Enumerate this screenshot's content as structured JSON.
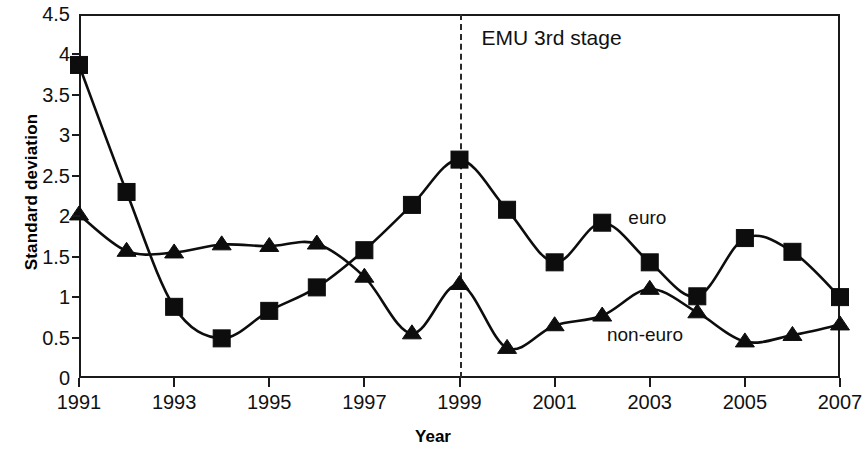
{
  "figure": {
    "background": "#ffffff",
    "ink_color": "#0d0d0d"
  },
  "axes": {
    "y_title": "Standard deviation",
    "x_title": "Year",
    "y_ticks": [
      "0",
      "0.5",
      "1",
      "1.5",
      "2",
      "2.5",
      "3",
      "3.5",
      "4",
      "4.5"
    ],
    "x_ticks": [
      "1991",
      "1993",
      "1995",
      "1997",
      "1999",
      "2001",
      "2003",
      "2005",
      "2007"
    ]
  },
  "annotations": {
    "emu_label": "EMU 3rd stage",
    "emu_year": 1999,
    "euro_label": "euro",
    "non_euro_label": "non-euro"
  },
  "chart_data": {
    "type": "line",
    "title": "",
    "xlabel": "Year",
    "ylabel": "Standard deviation",
    "xlim": [
      1991,
      2007
    ],
    "ylim": [
      0,
      4.5
    ],
    "ytick_step": 0.5,
    "xtick_step": 2,
    "grid": false,
    "legend_position": "inline-labels",
    "x": [
      1991,
      1992,
      1993,
      1994,
      1995,
      1996,
      1997,
      1998,
      1999,
      2000,
      2001,
      2002,
      2003,
      2004,
      2005,
      2006,
      2007
    ],
    "series": [
      {
        "name": "euro",
        "marker": "square",
        "color": "#0d0d0d",
        "values": [
          3.87,
          2.3,
          0.88,
          0.49,
          0.83,
          1.12,
          1.58,
          2.14,
          2.7,
          2.08,
          1.43,
          1.92,
          1.43,
          1.01,
          1.73,
          1.56,
          1.0
        ]
      },
      {
        "name": "non-euro",
        "marker": "triangle",
        "color": "#0d0d0d",
        "values": [
          2.02,
          1.57,
          1.55,
          1.65,
          1.63,
          1.66,
          1.25,
          0.55,
          1.16,
          0.37,
          0.65,
          0.77,
          1.1,
          0.81,
          0.45,
          0.53,
          0.66
        ]
      }
    ],
    "annotations": [
      {
        "type": "vline",
        "x": 1999,
        "style": "dashed",
        "text": "EMU 3rd stage"
      },
      {
        "type": "series-label",
        "text": "euro",
        "x": 2002.6,
        "y": 1.95
      },
      {
        "type": "series-label",
        "text": "non-euro",
        "x": 2002.3,
        "y": 0.52
      }
    ]
  }
}
